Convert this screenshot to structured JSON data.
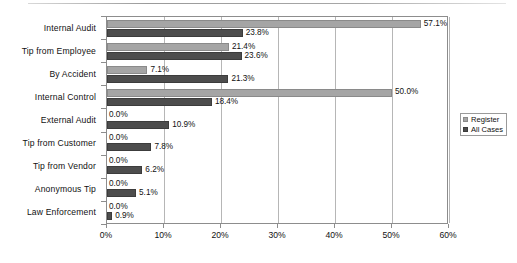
{
  "chart_data": {
    "type": "bar",
    "orientation": "horizontal",
    "title": "",
    "subtitle": "",
    "xlabel": "",
    "ylabel": "",
    "xlim": [
      0,
      60
    ],
    "grid": true,
    "legend_position": "right",
    "categories": [
      "Internal Audit",
      "Tip from Employee",
      "By Accident",
      "Internal Control",
      "External Audit",
      "Tip from Customer",
      "Tip from Vendor",
      "Anonymous Tip",
      "Law Enforcement"
    ],
    "series": [
      {
        "name": "Register",
        "color": "#a5a5a5",
        "values": [
          57.1,
          21.4,
          7.1,
          50.0,
          0.0,
          0.0,
          0.0,
          0.0,
          0.0
        ],
        "labels": [
          "57.1%",
          "21.4%",
          "7.1%",
          "50.0%",
          "0.0%",
          "0.0%",
          "0.0%",
          "0.0%",
          "0.0%"
        ]
      },
      {
        "name": "All Cases",
        "color": "#4d4d4d",
        "values": [
          23.8,
          23.6,
          21.3,
          18.4,
          10.9,
          7.8,
          6.2,
          5.1,
          0.9
        ],
        "labels": [
          "23.8%",
          "23.6%",
          "21.3%",
          "18.4%",
          "10.9%",
          "7.8%",
          "6.2%",
          "5.1%",
          "0.9%"
        ]
      }
    ],
    "xticks": [
      0,
      10,
      20,
      30,
      40,
      50,
      60
    ],
    "xtick_labels": [
      "0%",
      "10%",
      "20%",
      "30%",
      "40%",
      "50%",
      "60%"
    ]
  },
  "legend": {
    "items": [
      {
        "label": "Register"
      },
      {
        "label": "All Cases"
      }
    ]
  }
}
